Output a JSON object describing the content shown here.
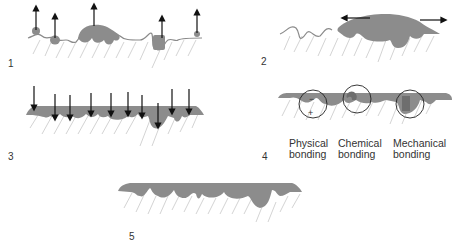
{
  "colors": {
    "adhesive": "#8c8c8c",
    "adhesive_dark": "#6e6e6e",
    "substrate_line": "#8a8a8a",
    "hatch": "#c2c2c2",
    "arrow": "#111111",
    "circle": "#222222",
    "text": "#333333"
  },
  "panels": [
    {
      "number": "1",
      "description": "Droplets partially wetting rough substrate; arrows pointing upward"
    },
    {
      "number": "2",
      "description": "Adhesive spreading across substrate; arrows pointing left and right"
    },
    {
      "number": "3",
      "description": "Adhesive pressed into substrate pores; arrows pointing downward"
    },
    {
      "number": "4",
      "description": "Bonding mechanisms",
      "charges": {
        "minus": "−",
        "plus": "+"
      }
    },
    {
      "number": "5",
      "description": "Fully wetted substrate with continuous adhesive layer"
    }
  ],
  "bonding_labels": [
    {
      "line1": "Physical",
      "line2": "bonding"
    },
    {
      "line1": "Chemical",
      "line2": "bonding"
    },
    {
      "line1": "Mechanical",
      "line2": "bonding"
    }
  ]
}
